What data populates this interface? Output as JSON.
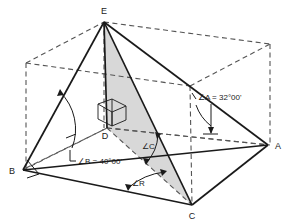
{
  "figure": {
    "background_color": "#ffffff",
    "solid_line_color": "#1a1a1a",
    "dashed_line_color": "#555555",
    "shade_color": "#d6d6d6",
    "vertices": [
      {
        "name": "E",
        "label": "E",
        "x": 104,
        "y": 22,
        "label_x": 104,
        "label_y": 12
      },
      {
        "name": "B",
        "label": "B",
        "x": 23,
        "y": 170,
        "label_x": 12,
        "label_y": 173
      },
      {
        "name": "A",
        "label": "A",
        "x": 268,
        "y": 145,
        "label_x": 278,
        "label_y": 148
      },
      {
        "name": "C",
        "label": "C",
        "x": 192,
        "y": 205,
        "label_x": 192,
        "label_y": 218
      },
      {
        "name": "D",
        "label": "D",
        "x": 107,
        "y": 128,
        "label_x": 104,
        "label_y": 137
      }
    ],
    "annotations": [
      {
        "name": "angle-a",
        "text": "∠A = 32°00'",
        "x": 198,
        "y": 97
      },
      {
        "name": "angle-b",
        "text": "∠B = 40°00'",
        "x": 72,
        "y": 165
      },
      {
        "name": "angle-c",
        "text": "∠C",
        "x": 146,
        "y": 145
      },
      {
        "name": "angle-r",
        "text": "∠R",
        "x": 139,
        "y": 182
      }
    ],
    "angle_values": {
      "A": "32°00'",
      "B": "40°00'",
      "C": "",
      "R": ""
    },
    "shaded_face": "E-D-C",
    "right_angle_markers": [
      "D",
      "B"
    ]
  }
}
